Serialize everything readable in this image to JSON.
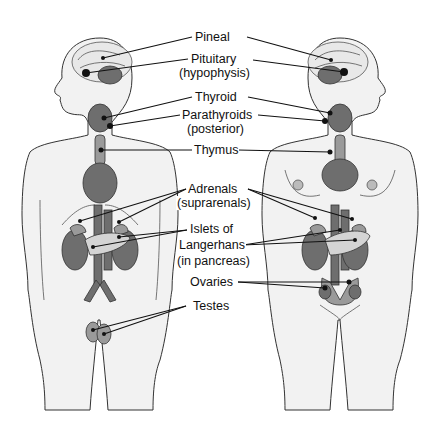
{
  "diagram": {
    "labels": [
      {
        "id": "pineal",
        "text": "Pineal",
        "sub": ""
      },
      {
        "id": "pituitary",
        "text": "Pituitary",
        "sub": "(hypophysis)"
      },
      {
        "id": "thyroid",
        "text": "Thyroid",
        "sub": ""
      },
      {
        "id": "parathyroids",
        "text": "Parathyroids",
        "sub": "(posterior)"
      },
      {
        "id": "thymus",
        "text": "Thymus",
        "sub": ""
      },
      {
        "id": "adrenals",
        "text": "Adrenals",
        "sub": "(suprarenals)"
      },
      {
        "id": "islets",
        "text": "Islets of",
        "sub": "Langerhans",
        "sub2": "(in pancreas)"
      },
      {
        "id": "ovaries",
        "text": "Ovaries",
        "sub": ""
      },
      {
        "id": "testes",
        "text": "Testes",
        "sub": ""
      }
    ],
    "figures": [
      {
        "id": "male",
        "side": "left"
      },
      {
        "id": "female",
        "side": "right"
      }
    ],
    "colors": {
      "background": "#ffffff",
      "body": "#f2f2f2",
      "organ_dark": "#6e6e6e",
      "organ_mid": "#9a9a9a",
      "organ_light": "#d4d4d4",
      "line": "#111111"
    }
  }
}
